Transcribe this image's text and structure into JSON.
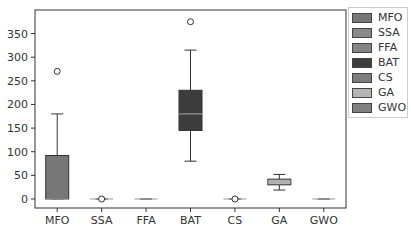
{
  "chart_data": {
    "type": "box",
    "title": "",
    "xlabel": "",
    "ylabel": "",
    "ylim": [
      -20,
      392
    ],
    "yticks": [
      0,
      50,
      100,
      150,
      200,
      250,
      300,
      350
    ],
    "categories": [
      "MFO",
      "SSA",
      "FFA",
      "BAT",
      "CS",
      "GA",
      "GWO"
    ],
    "series": [
      {
        "name": "MFO",
        "color": "#777777",
        "whisker_low": 0,
        "q1": 0,
        "median": 0,
        "q3": 92,
        "whisker_high": 180,
        "outliers": [
          270
        ]
      },
      {
        "name": "SSA",
        "color": "#8a8a8a",
        "whisker_low": 0,
        "q1": 0,
        "median": 0,
        "q3": 0,
        "whisker_high": 0,
        "outliers": [
          0
        ]
      },
      {
        "name": "FFA",
        "color": "#858585",
        "whisker_low": 0,
        "q1": 0,
        "median": 0,
        "q3": 0,
        "whisker_high": 0,
        "outliers": []
      },
      {
        "name": "BAT",
        "color": "#3c3c3c",
        "whisker_low": 80,
        "q1": 145,
        "median": 180,
        "q3": 230,
        "whisker_high": 315,
        "outliers": [
          375
        ]
      },
      {
        "name": "CS",
        "color": "#7d7d7d",
        "whisker_low": 0,
        "q1": 0,
        "median": 0,
        "q3": 0,
        "whisker_high": 0,
        "outliers": [
          0
        ]
      },
      {
        "name": "GA",
        "color": "#b5b5b5",
        "whisker_low": 19,
        "q1": 30,
        "median": 36,
        "q3": 42,
        "whisker_high": 52,
        "outliers": []
      },
      {
        "name": "GWO",
        "color": "#808080",
        "whisker_low": 0,
        "q1": 0,
        "median": 0,
        "q3": 0,
        "whisker_high": 0,
        "outliers": []
      }
    ],
    "legend": {
      "placement": "outside-right",
      "entries": [
        "MFO",
        "SSA",
        "FFA",
        "BAT",
        "CS",
        "GA",
        "GWO"
      ]
    },
    "grid": false
  }
}
